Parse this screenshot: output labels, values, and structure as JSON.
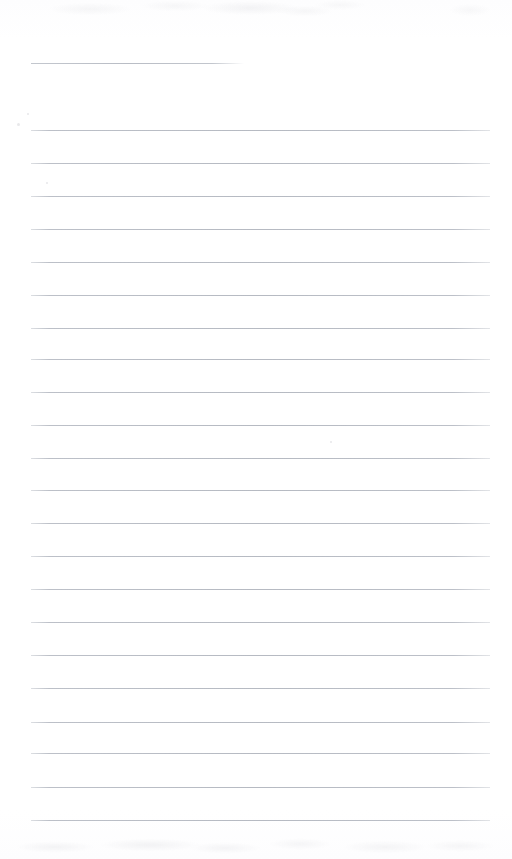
{
  "document": {
    "kind": "scanned-lined-notebook-page",
    "page_width": 512,
    "page_height": 859,
    "background_color": "#ffffff",
    "rule_color": "#bfc3ca",
    "content_text": "",
    "visible_text_items": []
  },
  "ruled_lines": {
    "count": 23,
    "left_margin_x": 31,
    "right_margin_x": 490,
    "spacing_px": 33,
    "items": [
      {
        "name": "rule-1",
        "y": 63,
        "x_start": 31,
        "x_end": 244,
        "style": "faded-right"
      },
      {
        "name": "rule-2",
        "y": 130,
        "x_start": 31,
        "x_end": 490,
        "style": "full"
      },
      {
        "name": "rule-3",
        "y": 163,
        "x_start": 31,
        "x_end": 490,
        "style": "full"
      },
      {
        "name": "rule-4",
        "y": 196,
        "x_start": 31,
        "x_end": 490,
        "style": "full"
      },
      {
        "name": "rule-5",
        "y": 229,
        "x_start": 31,
        "x_end": 490,
        "style": "full"
      },
      {
        "name": "rule-6",
        "y": 262,
        "x_start": 31,
        "x_end": 490,
        "style": "full"
      },
      {
        "name": "rule-7",
        "y": 295,
        "x_start": 31,
        "x_end": 490,
        "style": "full"
      },
      {
        "name": "rule-8",
        "y": 328,
        "x_start": 31,
        "x_end": 490,
        "style": "full"
      },
      {
        "name": "rule-9",
        "y": 359,
        "x_start": 31,
        "x_end": 490,
        "style": "full"
      },
      {
        "name": "rule-10",
        "y": 392,
        "x_start": 31,
        "x_end": 490,
        "style": "full"
      },
      {
        "name": "rule-11",
        "y": 425,
        "x_start": 31,
        "x_end": 490,
        "style": "full"
      },
      {
        "name": "rule-12",
        "y": 458,
        "x_start": 31,
        "x_end": 490,
        "style": "full"
      },
      {
        "name": "rule-13",
        "y": 490,
        "x_start": 31,
        "x_end": 490,
        "style": "full"
      },
      {
        "name": "rule-14",
        "y": 523,
        "x_start": 31,
        "x_end": 490,
        "style": "full"
      },
      {
        "name": "rule-15",
        "y": 556,
        "x_start": 31,
        "x_end": 490,
        "style": "full"
      },
      {
        "name": "rule-16",
        "y": 589,
        "x_start": 31,
        "x_end": 490,
        "style": "full"
      },
      {
        "name": "rule-17",
        "y": 622,
        "x_start": 31,
        "x_end": 490,
        "style": "full"
      },
      {
        "name": "rule-18",
        "y": 655,
        "x_start": 31,
        "x_end": 490,
        "style": "full"
      },
      {
        "name": "rule-19",
        "y": 688,
        "x_start": 31,
        "x_end": 490,
        "style": "full"
      },
      {
        "name": "rule-20",
        "y": 722,
        "x_start": 31,
        "x_end": 490,
        "style": "full"
      },
      {
        "name": "rule-21",
        "y": 753,
        "x_start": 31,
        "x_end": 490,
        "style": "full"
      },
      {
        "name": "rule-22",
        "y": 787,
        "x_start": 31,
        "x_end": 490,
        "style": "full"
      },
      {
        "name": "rule-23",
        "y": 820,
        "x_start": 31,
        "x_end": 490,
        "style": "full"
      }
    ]
  },
  "scan_artifacts": {
    "top_noise_band": {
      "y": 0,
      "height": 32
    },
    "bottom_noise_band": {
      "y": 831,
      "height": 28
    },
    "specks": [
      {
        "x": 17,
        "y": 123,
        "size": 3
      },
      {
        "x": 27,
        "y": 113,
        "size": 2
      },
      {
        "x": 330,
        "y": 441,
        "size": 2
      },
      {
        "x": 46,
        "y": 182,
        "size": 2
      }
    ]
  }
}
